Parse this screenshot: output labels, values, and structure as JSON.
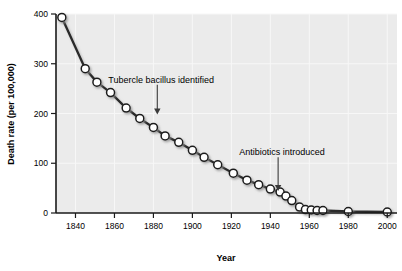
{
  "chart_data": {
    "type": "line",
    "title": "",
    "xlabel": "Year",
    "ylabel": "Death rate (per 100,000)",
    "xlim": [
      1830,
      2005
    ],
    "ylim": [
      0,
      400
    ],
    "grid": true,
    "legend_position": "none",
    "xticks": [
      1840,
      1860,
      1880,
      1900,
      1920,
      1940,
      1960,
      1980,
      2000
    ],
    "xtick_labels": [
      "1840",
      "1860",
      "1880",
      "1900",
      "1920",
      "1940",
      "1960",
      "1980",
      "2000"
    ],
    "yticks": [
      0,
      100,
      200,
      300,
      400
    ],
    "ytick_labels": [
      "0",
      "100",
      "200",
      "300",
      "400"
    ],
    "series": [
      {
        "name": "Tuberculosis death rate",
        "marker": "circle-open",
        "color": "#333333",
        "x": [
          1833,
          1845,
          1851,
          1858,
          1866,
          1873,
          1880,
          1886,
          1893,
          1900,
          1906,
          1913,
          1921,
          1928,
          1934,
          1940,
          1945,
          1948,
          1951,
          1955,
          1958,
          1961,
          1964,
          1967,
          1980,
          2000
        ],
        "y": [
          393,
          290,
          263,
          242,
          211,
          190,
          172,
          155,
          142,
          126,
          112,
          97,
          80,
          66,
          57,
          48,
          42,
          34,
          25,
          12,
          7,
          6,
          5,
          5,
          3,
          2
        ]
      }
    ],
    "annotations": [
      {
        "name": "tubercle-bacillus-identified",
        "text": "Tubercle bacillus identified",
        "year": 1882,
        "text_x": 1884,
        "text_y": 268,
        "arrow_from_y": 258,
        "arrow_to_y": 198
      },
      {
        "name": "antibiotics-introduced",
        "text": "Antibiotics introduced",
        "year": 1944,
        "text_x": 1946,
        "text_y": 122,
        "arrow_from_y": 112,
        "arrow_to_y": 44
      }
    ]
  },
  "axes": {
    "x_title": "Year",
    "y_title": "Death rate (per 100,000)"
  },
  "colors": {
    "plot_background": "#ebebeb",
    "line": "#2b2b2b",
    "marker_fill": "#ffffff",
    "marker_stroke": "#1a1a1a",
    "gridline": "#f7f7f7",
    "axis": "#1a1a1a",
    "text": "#000000"
  }
}
